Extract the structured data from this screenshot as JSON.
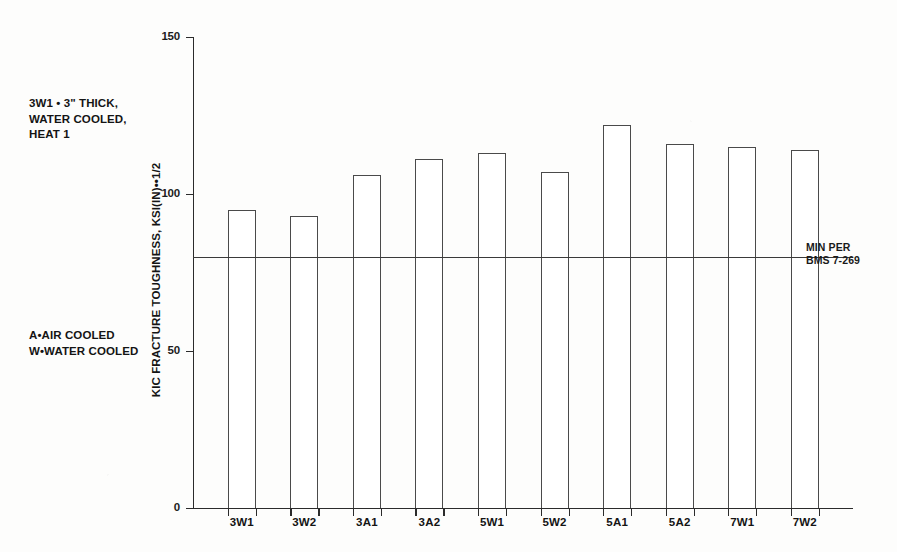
{
  "chart_data": {
    "type": "bar",
    "title": "",
    "xlabel": "",
    "ylabel": "KIC FRACTURE TOUGHNESS, KSI(IN)••1/2",
    "ylim": [
      0,
      150
    ],
    "yticks": [
      0,
      50,
      100,
      150
    ],
    "ytick_labels": [
      "0",
      "50",
      "100",
      "150"
    ],
    "grid": false,
    "legend": "none",
    "categories": [
      "3W1",
      "3W2",
      "3A1",
      "3A2",
      "5W1",
      "5W2",
      "5A1",
      "5A2",
      "7W1",
      "7W2"
    ],
    "values": [
      95,
      93,
      106,
      111,
      113,
      107,
      122,
      116,
      115,
      114
    ],
    "bar_style": "outlined-unfilled",
    "annotations": [
      {
        "name": "min-spec-line",
        "type": "horizontal-line",
        "value": 80,
        "label": "MIN PER\nBMS 7-269"
      },
      {
        "name": "legend-key-note",
        "type": "text",
        "label": "3W1 • 3\" THICK,\nWATER COOLED,\nHEAT 1"
      },
      {
        "name": "cooling-key-note",
        "type": "text",
        "label": "A•AIR COOLED\nW•WATER COOLED"
      }
    ]
  },
  "chart": {
    "y_axis_title": "KIC FRACTURE TOUGHNESS, KSI(IN)••1/2",
    "min_line_label_1": "MIN PER",
    "min_line_label_2": "BMS 7-269",
    "note_legend_key": "3W1 • 3\" THICK,\nWATER COOLED,\nHEAT 1",
    "note_cooling_key": "A•AIR COOLED\nW•WATER COOLED"
  },
  "colors": {
    "background": "#fdfdfc",
    "axis": "#2b2b2b",
    "bar_outline": "#4a4a4a",
    "bar_fill": "#ffffff",
    "min_line": "#3a3a3a",
    "text": "#141414"
  }
}
